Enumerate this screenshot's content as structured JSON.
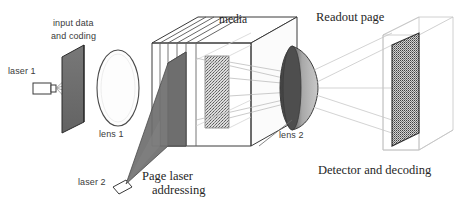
{
  "figure": {
    "type": "optical-system-diagram",
    "background": "#ffffff",
    "ink": "#2b2b2b"
  },
  "labels": {
    "input_data": "input data",
    "and_coding": "and coding",
    "laser1": "laser 1",
    "lens1": "lens 1",
    "media": "media",
    "laser2": "laser 2",
    "page_laser": "Page laser",
    "addressing": "addressing",
    "lens2": "lens 2",
    "readout_page": "Readout page",
    "detector": "Detector and decoding"
  },
  "components": {
    "laser1": {
      "name": "laser 1",
      "shape": "small-box-emitter",
      "fill": "#ffffff",
      "stroke": "#3a3a3a"
    },
    "input_plate": {
      "name": "input data and coding plate",
      "fill": "#6f6f6f",
      "stroke": "#2b2b2b"
    },
    "lens1": {
      "name": "lens 1",
      "shape": "ellipse",
      "fill": "#fdfdfd",
      "stroke": "#4a4a4a"
    },
    "media_cube": {
      "name": "media",
      "shape": "cube",
      "fill": "#ffffff",
      "stroke": "#3a3a3a"
    },
    "media_plates": {
      "count": 5,
      "fill": "#f4f4f4",
      "stroke": "#555555"
    },
    "shaded_plate": {
      "name": "page laser addressed plate",
      "fill": "#707070"
    },
    "hologram_plate": {
      "name": "speckled hologram plate",
      "fill": "#d8d8d8",
      "speckle": "#5c5c5c"
    },
    "laser2": {
      "name": "laser 2",
      "shape": "small-box-emitter",
      "fill": "#ffffff",
      "stroke": "#3a3a3a"
    },
    "beam_cone": {
      "name": "page addressing beam",
      "fill": "#6e6e6e"
    },
    "lens2": {
      "name": "lens 2",
      "shape": "ellipse-lens",
      "fill_dark": "#4e4e4e",
      "fill_light": "#b9b9b9"
    },
    "detector": {
      "name": "detector and decoding plate",
      "fill": "#cfcfcf",
      "speckle": "#444444"
    },
    "detector_box": {
      "name": "detector wireframe enclosure",
      "stroke": "#bdbdbd"
    }
  }
}
